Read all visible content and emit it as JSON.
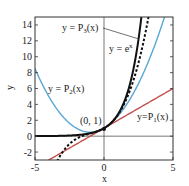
{
  "chart_data": {
    "type": "line",
    "title": "",
    "xlabel": "x",
    "ylabel": "y",
    "xlim": [
      -5,
      5
    ],
    "ylim": [
      -3,
      15
    ],
    "xticks": [
      -5,
      0,
      5
    ],
    "yticks": [
      -2,
      0,
      2,
      4,
      6,
      8,
      10,
      12,
      14
    ],
    "grid": false,
    "legend": "inline labels",
    "series": [
      {
        "name": "y = e^x",
        "expr": "exp(x)",
        "style": "solid",
        "color": "#111111",
        "width": 2
      },
      {
        "name": "y = P3(x)",
        "expr": "1 + x + x^2/2 + x^3/6",
        "style": "dashed",
        "color": "#111111",
        "width": 2
      },
      {
        "name": "y = P2(x)",
        "expr": "1 + x + x^2/2",
        "style": "solid",
        "color": "#5aa6d6",
        "width": 1.4
      },
      {
        "name": "y = P1(x)",
        "expr": "1 + x",
        "style": "solid",
        "color": "#c0504d",
        "width": 1.4
      }
    ],
    "annotations": [
      {
        "text": "(0, 1)",
        "x": 0,
        "y": 1,
        "marker": "dot"
      }
    ]
  },
  "labels": {
    "ex": "y = e",
    "ex_sup": "x",
    "p3": "y = P",
    "p3_sub": "3",
    "p3_tail": "(x)",
    "p2": "y = P",
    "p2_sub": "2",
    "p2_tail": "(x)",
    "p1": "y=P",
    "p1_sub": "1",
    "p1_tail": "(x)",
    "point": "(0, 1)",
    "xlabel": "x",
    "ylabel": "y"
  }
}
